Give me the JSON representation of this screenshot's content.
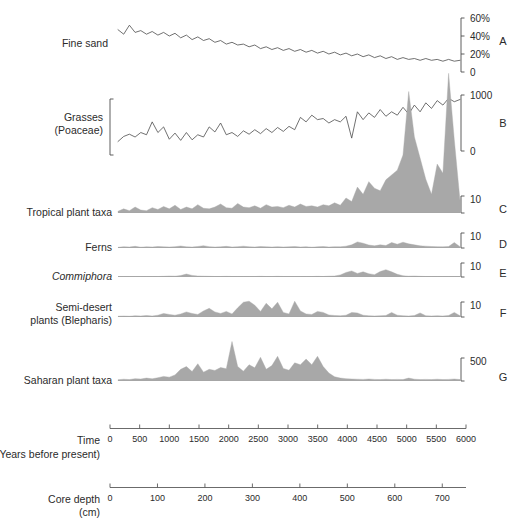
{
  "figure": {
    "title": "",
    "background": "#ffffff",
    "fill_color": "#a8a8a8",
    "line_color": "#4d4d4d",
    "axis_color": "#5a5a5a"
  },
  "panels": [
    {
      "letter": "A",
      "label_lines": [
        "Fine sand"
      ],
      "style": "line",
      "axis_ticks": [
        "60%",
        "40%",
        "20%",
        "0"
      ],
      "scale_max_label": "60%",
      "scale_min_label": "0"
    },
    {
      "letter": "B",
      "label_lines": [
        "Grasses",
        "(Poaceae)"
      ],
      "style": "line",
      "axis_ticks": [
        "1000",
        "0"
      ],
      "scale_max_label": "1000",
      "scale_min_label": "0"
    },
    {
      "letter": "C",
      "label_lines": [
        "Tropical plant taxa"
      ],
      "style": "fill",
      "axis_ticks": [
        "10"
      ],
      "scale_max_label": "10",
      "scale_min_label": ""
    },
    {
      "letter": "D",
      "label_lines": [
        "Ferns"
      ],
      "style": "fill",
      "axis_ticks": [
        "10"
      ],
      "scale_max_label": "10",
      "scale_min_label": ""
    },
    {
      "letter": "E",
      "label_lines": [
        "Commiphora"
      ],
      "label_italic": [
        true
      ],
      "style": "fill",
      "axis_ticks": [
        "10"
      ],
      "scale_max_label": "10",
      "scale_min_label": ""
    },
    {
      "letter": "F",
      "label_lines": [
        "Semi-desert",
        "plants (Blepharis)"
      ],
      "style": "fill",
      "axis_ticks": [
        "10"
      ],
      "scale_max_label": "10",
      "scale_min_label": ""
    },
    {
      "letter": "G",
      "label_lines": [
        "Saharan plant taxa"
      ],
      "style": "fill",
      "axis_ticks": [
        "500"
      ],
      "scale_max_label": "500",
      "scale_min_label": ""
    }
  ],
  "axes": {
    "time": {
      "title_lines": [
        "Time",
        "(Years before present)"
      ],
      "ticks": [
        "0",
        "500",
        "1000",
        "1500",
        "2000",
        "2500",
        "3000",
        "3500",
        "4000",
        "4500",
        "5000",
        "5500",
        "6000"
      ],
      "min": 0,
      "max": 6000,
      "step": 500,
      "unit": "Years before present"
    },
    "depth": {
      "title_lines": [
        "Core depth",
        "(cm)"
      ],
      "ticks": [
        "0",
        "100",
        "200",
        "300",
        "400",
        "500",
        "600",
        "700"
      ],
      "min": 0,
      "max": 750,
      "step": 100,
      "unit": "cm"
    }
  },
  "chart_data": {
    "type": "area",
    "xlabel": "Time (Years before present)",
    "ylabel": "",
    "x_secondary_label": "Core depth (cm)",
    "x": [
      0,
      100,
      200,
      300,
      400,
      500,
      600,
      700,
      800,
      900,
      1000,
      1100,
      1200,
      1300,
      1400,
      1500,
      1600,
      1700,
      1800,
      1900,
      2000,
      2100,
      2200,
      2300,
      2400,
      2500,
      2600,
      2700,
      2800,
      2900,
      3000,
      3100,
      3200,
      3300,
      3400,
      3500,
      3600,
      3700,
      3800,
      3900,
      4000,
      4100,
      4200,
      4300,
      4400,
      4500,
      4600,
      4700,
      4800,
      4900,
      5000,
      5100,
      5200,
      5300,
      5400,
      5500,
      5600,
      5700,
      5800,
      5900,
      6000
    ],
    "x_axis_range": [
      0,
      6000
    ],
    "x_axis_tick_step": 500,
    "grid": false,
    "legend": "none",
    "series": [
      {
        "name": "Fine sand",
        "panel": "A",
        "units": "%",
        "y_range": [
          0,
          60
        ],
        "y_ticks": [
          0,
          20,
          40,
          60
        ],
        "render": "line",
        "values": [
          47,
          42,
          52,
          44,
          46,
          42,
          45,
          41,
          44,
          40,
          43,
          38,
          41,
          36,
          39,
          35,
          37,
          33,
          35,
          31,
          33,
          30,
          31,
          28,
          30,
          26,
          28,
          25,
          27,
          24,
          26,
          23,
          25,
          22,
          24,
          21,
          23,
          20,
          22,
          19,
          21,
          18,
          20,
          17,
          19,
          16,
          18,
          15,
          17,
          14,
          16,
          14,
          15,
          13,
          15,
          13,
          14,
          12,
          14,
          12,
          13
        ]
      },
      {
        "name": "Grasses (Poaceae)",
        "panel": "B",
        "units": "grains",
        "y_range": [
          0,
          1000
        ],
        "y_ticks": [
          0,
          1000
        ],
        "render": "line",
        "values": [
          170,
          260,
          300,
          250,
          330,
          290,
          520,
          330,
          430,
          210,
          320,
          190,
          330,
          200,
          290,
          250,
          430,
          340,
          500,
          290,
          330,
          260,
          360,
          300,
          380,
          310,
          400,
          330,
          420,
          350,
          440,
          380,
          600,
          520,
          640,
          560,
          580,
          500,
          560,
          520,
          620,
          230,
          700,
          560,
          680,
          600,
          740,
          620,
          700,
          640,
          780,
          660,
          820,
          700,
          860,
          760,
          900,
          820,
          940,
          880,
          920
        ]
      },
      {
        "name": "Tropical plant taxa",
        "panel": "C",
        "units": "%",
        "y_range": [
          0,
          10
        ],
        "y_ticks": [
          0,
          10
        ],
        "render": "fill",
        "values": [
          0.2,
          0.6,
          0.3,
          0.9,
          0.4,
          0.3,
          0.8,
          0.5,
          1.0,
          0.6,
          1.2,
          0.5,
          0.9,
          0.6,
          1.3,
          0.7,
          0.6,
          0.9,
          1.4,
          0.8,
          0.7,
          1.5,
          0.9,
          0.8,
          1.1,
          0.7,
          1.3,
          0.9,
          1.0,
          0.8,
          1.2,
          0.9,
          1.4,
          1.0,
          1.1,
          0.9,
          1.3,
          1.1,
          1.6,
          1.2,
          2.4,
          1.8,
          4.2,
          3.0,
          5.1,
          4.0,
          3.6,
          5.4,
          6.2,
          7.0,
          9.5,
          20.0,
          12.5,
          9.0,
          5.5,
          3.0,
          8.0,
          6.5,
          23.0,
          12.0,
          2.0
        ]
      },
      {
        "name": "Ferns",
        "panel": "D",
        "units": "%",
        "y_range": [
          0,
          10
        ],
        "y_ticks": [
          0,
          10
        ],
        "render": "fill",
        "values": [
          0.1,
          0.5,
          0.3,
          0.7,
          0.2,
          0.4,
          0.3,
          0.6,
          0.4,
          0.3,
          0.5,
          0.9,
          0.4,
          0.3,
          0.6,
          1.1,
          0.5,
          0.3,
          0.4,
          0.7,
          0.3,
          0.5,
          0.8,
          0.4,
          0.3,
          0.6,
          0.4,
          0.3,
          0.5,
          0.3,
          0.4,
          0.6,
          0.3,
          0.5,
          0.2,
          0.4,
          0.6,
          0.3,
          0.5,
          0.4,
          0.8,
          1.6,
          3.4,
          2.6,
          1.5,
          1.0,
          1.6,
          1.2,
          3.0,
          2.0,
          3.2,
          2.2,
          1.6,
          1.0,
          0.8,
          0.6,
          0.5,
          0.4,
          0.6,
          3.0,
          0.5
        ]
      },
      {
        "name": "Commiphora",
        "panel": "E",
        "units": "%",
        "y_range": [
          0,
          10
        ],
        "y_ticks": [
          0,
          10
        ],
        "render": "fill",
        "values": [
          0.0,
          0.0,
          0.0,
          0.0,
          0.0,
          0.0,
          0.0,
          0.0,
          0.1,
          0.3,
          0.2,
          0.6,
          1.6,
          0.7,
          0.3,
          0.2,
          0.1,
          0.0,
          0.0,
          0.1,
          0.0,
          0.0,
          0.0,
          0.0,
          0.0,
          0.1,
          0.0,
          0.0,
          0.1,
          0.0,
          0.0,
          0.0,
          0.0,
          0.0,
          0.0,
          0.1,
          0.0,
          0.2,
          0.3,
          1.0,
          2.6,
          3.6,
          2.0,
          3.0,
          1.8,
          1.2,
          3.2,
          4.4,
          3.0,
          1.4,
          0.5,
          0.2,
          0.3,
          0.1,
          0.0,
          0.0,
          0.0,
          0.0,
          0.0,
          0.0,
          0.0
        ]
      },
      {
        "name": "Semi-desert plants (Blepharis)",
        "panel": "F",
        "units": "%",
        "y_range": [
          0,
          10
        ],
        "y_ticks": [
          0,
          10
        ],
        "render": "fill",
        "values": [
          0.1,
          0.2,
          0.1,
          0.3,
          0.2,
          0.4,
          0.2,
          0.5,
          1.2,
          0.8,
          0.5,
          1.0,
          1.8,
          1.2,
          0.8,
          2.2,
          3.2,
          1.8,
          1.2,
          2.0,
          1.0,
          3.4,
          5.6,
          6.0,
          4.4,
          2.0,
          5.2,
          3.0,
          5.6,
          1.6,
          1.0,
          6.0,
          2.2,
          1.0,
          0.8,
          2.0,
          1.6,
          0.6,
          0.4,
          0.3,
          0.5,
          1.6,
          1.4,
          0.5,
          0.3,
          0.2,
          0.3,
          0.4,
          1.6,
          0.5,
          0.3,
          0.2,
          0.4,
          1.4,
          0.3,
          0.2,
          0.3,
          0.2,
          0.4,
          1.6,
          0.3
        ]
      },
      {
        "name": "Saharan plant taxa",
        "panel": "G",
        "units": "grains",
        "y_range": [
          0,
          500
        ],
        "y_ticks": [
          0,
          500
        ],
        "render": "fill",
        "values": [
          8,
          14,
          10,
          20,
          16,
          26,
          18,
          30,
          44,
          36,
          60,
          120,
          150,
          96,
          180,
          90,
          120,
          108,
          140,
          126,
          420,
          150,
          100,
          170,
          136,
          250,
          120,
          160,
          260,
          130,
          110,
          190,
          170,
          230,
          170,
          260,
          150,
          80,
          40,
          26,
          20,
          16,
          14,
          12,
          16,
          12,
          10,
          14,
          10,
          12,
          10,
          26,
          14,
          10,
          12,
          10,
          14,
          10,
          12,
          16,
          10
        ]
      }
    ]
  }
}
